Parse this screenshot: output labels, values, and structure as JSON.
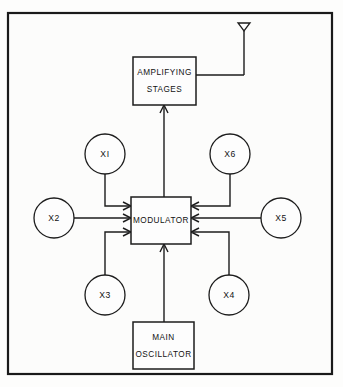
{
  "diagram": {
    "frame": {
      "name": "outer-frame",
      "x": 8,
      "y": 13,
      "width": 324,
      "height": 361
    },
    "colors": {
      "stroke": "#1c1c1c",
      "frame_stroke": "#1a1a1a",
      "fill": "#fdfdfd",
      "background": "#fdfdfc"
    },
    "boxes": [
      {
        "id": "amplifying-stages",
        "lines": [
          "AMPLIFYING",
          "STAGES"
        ],
        "x": 133,
        "y": 57,
        "width": 63,
        "height": 48
      },
      {
        "id": "modulator",
        "lines": [
          "MODULATOR"
        ],
        "x": 131,
        "y": 197,
        "width": 60,
        "height": 47
      },
      {
        "id": "main-oscillator",
        "lines": [
          "MAIN",
          "OSCILLATOR"
        ],
        "x": 133,
        "y": 322,
        "width": 61,
        "height": 47
      }
    ],
    "circles": [
      {
        "id": "x1",
        "label": "XI",
        "cx": 105,
        "cy": 154,
        "r": 20
      },
      {
        "id": "x6",
        "label": "X6",
        "cx": 230,
        "cy": 154,
        "r": 20
      },
      {
        "id": "x2",
        "label": "X2",
        "cx": 54,
        "cy": 218,
        "r": 20
      },
      {
        "id": "x5",
        "label": "X5",
        "cx": 281,
        "cy": 218,
        "r": 20
      },
      {
        "id": "x3",
        "label": "X3",
        "cx": 105,
        "cy": 295,
        "r": 20
      },
      {
        "id": "x4",
        "label": "X4",
        "cx": 229,
        "cy": 295,
        "r": 20
      }
    ],
    "antenna": {
      "id": "antenna",
      "label": "antenna-symbol",
      "mast_x": 244,
      "mast_top": 23,
      "mast_bottom": 75,
      "triangle_half_width": 6,
      "triangle_height": 8
    },
    "connections": [
      {
        "from": "x1",
        "to": "modulator",
        "side": "left-top"
      },
      {
        "from": "x2",
        "to": "modulator",
        "side": "left-middle"
      },
      {
        "from": "x3",
        "to": "modulator",
        "side": "left-bottom"
      },
      {
        "from": "x6",
        "to": "modulator",
        "side": "right-top"
      },
      {
        "from": "x5",
        "to": "modulator",
        "side": "right-middle"
      },
      {
        "from": "x4",
        "to": "modulator",
        "side": "right-bottom"
      },
      {
        "from": "main-oscillator",
        "to": "modulator",
        "side": "bottom"
      },
      {
        "from": "modulator",
        "to": "amplifying-stages",
        "side": "top"
      },
      {
        "from": "amplifying-stages",
        "to": "antenna",
        "side": "right"
      }
    ]
  }
}
